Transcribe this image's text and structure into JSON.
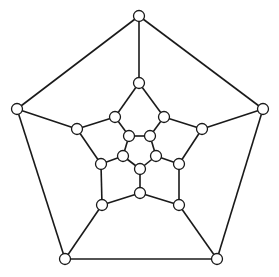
{
  "diagram": {
    "type": "graph",
    "colors": {
      "stroke": "#1a1a1a",
      "node_fill": "#ffffff",
      "background": "#ffffff"
    },
    "node_radius": 5.5,
    "nodes": [
      {
        "id": "O0",
        "x": 139,
        "y": 16
      },
      {
        "id": "O1",
        "x": 263,
        "y": 109
      },
      {
        "id": "O2",
        "x": 17,
        "y": 109
      },
      {
        "id": "O3",
        "x": 65,
        "y": 259
      },
      {
        "id": "O4",
        "x": 217,
        "y": 259
      },
      {
        "id": "A0",
        "x": 139,
        "y": 83
      },
      {
        "id": "A1",
        "x": 202,
        "y": 129
      },
      {
        "id": "A2",
        "x": 179,
        "y": 205
      },
      {
        "id": "A3",
        "x": 102,
        "y": 205
      },
      {
        "id": "A4",
        "x": 77,
        "y": 129
      },
      {
        "id": "B0",
        "x": 164,
        "y": 117
      },
      {
        "id": "B1",
        "x": 179,
        "y": 164
      },
      {
        "id": "B2",
        "x": 140,
        "y": 193
      },
      {
        "id": "B3",
        "x": 101,
        "y": 164
      },
      {
        "id": "B4",
        "x": 115,
        "y": 117
      },
      {
        "id": "I0",
        "x": 150,
        "y": 136
      },
      {
        "id": "I1",
        "x": 156,
        "y": 156
      },
      {
        "id": "I2",
        "x": 140,
        "y": 169
      },
      {
        "id": "I3",
        "x": 123,
        "y": 156
      },
      {
        "id": "I4",
        "x": 129,
        "y": 136
      }
    ],
    "edges": [
      [
        "O0",
        "O1"
      ],
      [
        "O1",
        "O4"
      ],
      [
        "O4",
        "O3"
      ],
      [
        "O3",
        "O2"
      ],
      [
        "O2",
        "O0"
      ],
      [
        "O0",
        "A0"
      ],
      [
        "O1",
        "A1"
      ],
      [
        "O4",
        "A2"
      ],
      [
        "O3",
        "A3"
      ],
      [
        "O2",
        "A4"
      ],
      [
        "A0",
        "B0"
      ],
      [
        "B0",
        "A1"
      ],
      [
        "A1",
        "B1"
      ],
      [
        "B1",
        "A2"
      ],
      [
        "A2",
        "B2"
      ],
      [
        "B2",
        "A3"
      ],
      [
        "A3",
        "B3"
      ],
      [
        "B3",
        "A4"
      ],
      [
        "A4",
        "B4"
      ],
      [
        "B4",
        "A0"
      ],
      [
        "B0",
        "I0"
      ],
      [
        "B1",
        "I1"
      ],
      [
        "B2",
        "I2"
      ],
      [
        "B3",
        "I3"
      ],
      [
        "B4",
        "I4"
      ],
      [
        "I0",
        "I1"
      ],
      [
        "I1",
        "I2"
      ],
      [
        "I2",
        "I3"
      ],
      [
        "I3",
        "I4"
      ],
      [
        "I4",
        "I0"
      ]
    ]
  }
}
